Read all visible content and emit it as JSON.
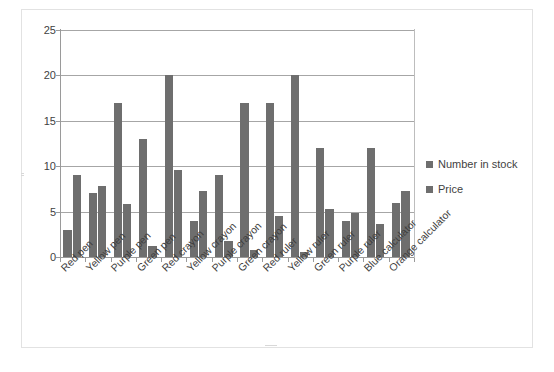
{
  "chart_data": {
    "type": "bar",
    "title": "",
    "subtitle": "",
    "xlabel": "",
    "ylabel": "",
    "ylim": [
      0,
      25
    ],
    "yticks": [
      0,
      5,
      10,
      15,
      20,
      25
    ],
    "grid": true,
    "legend_position": "right",
    "categories": [
      "Red pen",
      "Yellow pen",
      "Purple pen",
      "Green pen",
      "Red crayon",
      "Yellow crayon",
      "Purple crayon",
      "Green crayon",
      "Red ruler",
      "Yellow ruler",
      "Green ruler",
      "Purple ruler",
      "Blue calculator",
      "Orange calculator"
    ],
    "series": [
      {
        "name": "Number in stock",
        "color": "#6e6e6e",
        "values": [
          3,
          7,
          17,
          13,
          20,
          4,
          9,
          17,
          17,
          20,
          12,
          4,
          12,
          6
        ]
      },
      {
        "name": "Price",
        "color": "#6e6e6e",
        "values": [
          9.0,
          7.8,
          5.8,
          1.2,
          9.6,
          7.3,
          1.8,
          0.8,
          4.5,
          0.5,
          5.3,
          4.9,
          3.6,
          7.3
        ]
      }
    ]
  },
  "axis": {
    "y_tick_labels": [
      "25",
      "20",
      "15",
      "10",
      "5",
      "0"
    ]
  },
  "legend": {
    "items": [
      {
        "label": "Number in stock",
        "swatch": "legend-swatch-icon"
      },
      {
        "label": "Price",
        "swatch": "legend-swatch-icon"
      }
    ]
  }
}
